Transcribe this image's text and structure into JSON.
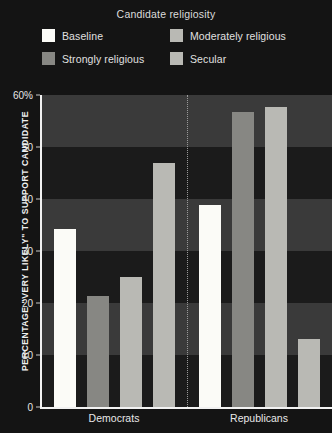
{
  "legend": {
    "title": "Candidate religiosity",
    "entries": [
      {
        "label": "Baseline",
        "color": "#fbfbf7"
      },
      {
        "label": "Moderately religious",
        "color": "#b9b9b4"
      },
      {
        "label": "Strongly religious",
        "color": "#878783"
      },
      {
        "label": "Secular",
        "color": "#b9b9b4"
      }
    ]
  },
  "chart_data": {
    "type": "bar",
    "title": "Candidate religiosity",
    "xlabel": "",
    "ylabel": "PERCENTAGE \"VERY LIKELY\" TO SUPPORT CANDIDATE",
    "ylim": [
      0,
      60
    ],
    "yticks": [
      0,
      10,
      20,
      30,
      40,
      50,
      60
    ],
    "ytick_labels": [
      "0",
      "10",
      "20",
      "30",
      "40",
      "50",
      "60%"
    ],
    "grid": false,
    "banded_background": true,
    "legend_position": "top",
    "categories": [
      "Democrats",
      "Republicans"
    ],
    "series": [
      {
        "name": "Baseline",
        "color": "#fbfbf7",
        "values": [
          34.3,
          38.9
        ]
      },
      {
        "name": "Strongly religious",
        "color": "#878783",
        "values": [
          21.3,
          56.7
        ]
      },
      {
        "name": "Moderately religious",
        "color": "#b9b9b4",
        "values": [
          25.0,
          57.6
        ]
      },
      {
        "name": "Secular",
        "color": "#b9b9b4",
        "values": [
          46.9,
          13.0
        ]
      }
    ]
  },
  "colors": {
    "background": "#141414",
    "band_dark": "#1b1b1b",
    "band_light": "#3a3a3a",
    "axis": "#f2f2f2",
    "text": "#e8e8e8",
    "divider": "#9a9a9a"
  }
}
